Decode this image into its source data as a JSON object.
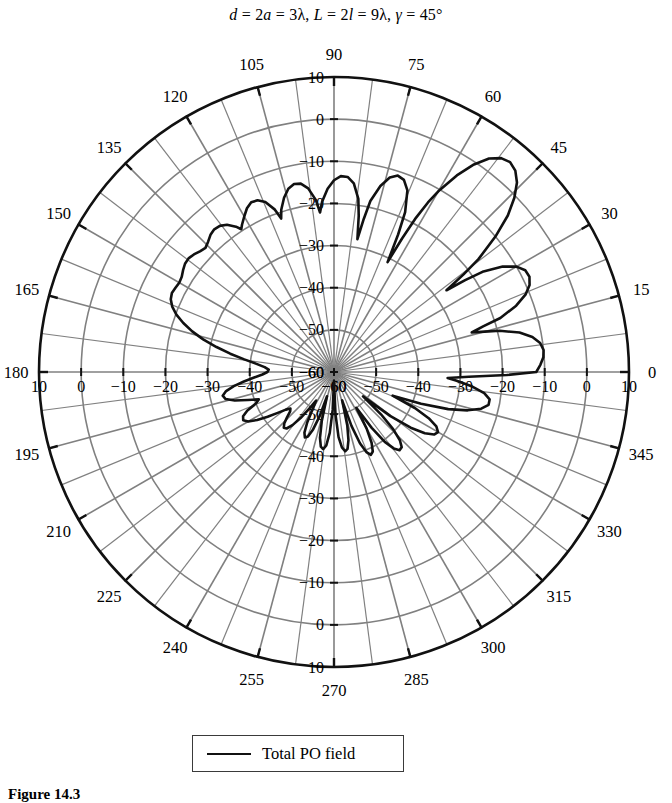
{
  "title": {
    "text": "d = 2a = 3λ, L = 2l = 9λ, γ = 45°",
    "parts": {
      "d": "d",
      "eq1": " = 2",
      "a": "a",
      "eq2": " = 3λ, ",
      "L": "L",
      "eq3": " = 2",
      "l": "l",
      "eq4": " = 9λ, ",
      "gamma": "γ",
      "eq5": " = 45°"
    }
  },
  "legend": {
    "entries": [
      {
        "label": "Total PO field",
        "color": "#111111",
        "style": "solid"
      }
    ]
  },
  "caption": {
    "text": "Figure 14.3"
  },
  "colors": {
    "curve": "#111111",
    "grid": "#808080",
    "outer_ring": "#111111",
    "text": "#000000",
    "background": "#ffffff"
  },
  "chart_data": {
    "type": "line",
    "plot_style": "polar",
    "title": "d = 2a = 3λ, L = 2l = 9λ, γ = 45°",
    "xlabel": "",
    "ylabel": "",
    "angle_unit": "degrees",
    "angle_direction": "counterclockwise",
    "angle_zero_at": "east",
    "angular_ticks": [
      0,
      15,
      30,
      45,
      60,
      75,
      90,
      105,
      120,
      135,
      150,
      165,
      180,
      195,
      210,
      225,
      240,
      255,
      270,
      285,
      300,
      315,
      330,
      345
    ],
    "angular_tick_labels": [
      "0",
      "15",
      "30",
      "45",
      "60",
      "75",
      "90",
      "105",
      "120",
      "135",
      "150",
      "165",
      "180",
      "195",
      "210",
      "225",
      "240",
      "255",
      "270",
      "285",
      "300",
      "315",
      "330",
      "345"
    ],
    "angular_minor_step": 7.5,
    "radial_ticks_db": [
      -60,
      -50,
      -40,
      -30,
      -20,
      -10,
      0,
      10
    ],
    "radial_tick_labels": [
      "−60",
      "−50",
      "−40",
      "−30",
      "−20",
      "−10",
      "0",
      "10"
    ],
    "rlim_db": [
      -60,
      10
    ],
    "radial_label_axes": [
      "90",
      "180",
      "0",
      "270"
    ],
    "grid": true,
    "legend_position": "below-plot",
    "series": [
      {
        "name": "Total PO field",
        "color": "#111111",
        "units": "dB",
        "description": "Physical-optics total far-field pattern of a reflector/horn; main beam near 45 deg reaching about +5 dB, broad smooth shoulder from 100-180 deg near -15 to -20 dB, dense narrow sidelobes through 250-350 deg.",
        "points_deg_db": [
          [
            0,
            -12.0
          ],
          [
            2,
            -11.0
          ],
          [
            4,
            -10.2
          ],
          [
            6,
            -10.0
          ],
          [
            8,
            -10.6
          ],
          [
            10,
            -12.2
          ],
          [
            12,
            -15.0
          ],
          [
            14,
            -19.5
          ],
          [
            15,
            -23.0
          ],
          [
            16,
            -26.0
          ],
          [
            17,
            -23.0
          ],
          [
            18,
            -18.5
          ],
          [
            20,
            -14.0
          ],
          [
            22,
            -11.0
          ],
          [
            24,
            -9.2
          ],
          [
            26,
            -8.4
          ],
          [
            28,
            -8.6
          ],
          [
            30,
            -10.0
          ],
          [
            32,
            -12.8
          ],
          [
            34,
            -17.5
          ],
          [
            35,
            -22.0
          ],
          [
            36,
            -27.0
          ],
          [
            37,
            -21.5
          ],
          [
            38,
            -16.5
          ],
          [
            40,
            -10.0
          ],
          [
            42,
            -4.5
          ],
          [
            44,
            -0.5
          ],
          [
            46,
            2.5
          ],
          [
            48,
            4.3
          ],
          [
            50,
            5.0
          ],
          [
            52,
            4.4
          ],
          [
            54,
            2.6
          ],
          [
            56,
            -0.6
          ],
          [
            58,
            -5.0
          ],
          [
            60,
            -10.5
          ],
          [
            61,
            -14.0
          ],
          [
            62,
            -18.5
          ],
          [
            63,
            -24.5
          ],
          [
            64,
            -31.0
          ],
          [
            65,
            -24.0
          ],
          [
            66,
            -18.5
          ],
          [
            68,
            -13.5
          ],
          [
            70,
            -11.5
          ],
          [
            72,
            -11.0
          ],
          [
            74,
            -12.0
          ],
          [
            76,
            -14.5
          ],
          [
            78,
            -18.5
          ],
          [
            79,
            -23.0
          ],
          [
            80,
            -28.0
          ],
          [
            81,
            -22.5
          ],
          [
            82,
            -18.5
          ],
          [
            84,
            -15.0
          ],
          [
            86,
            -13.6
          ],
          [
            88,
            -13.5
          ],
          [
            90,
            -14.5
          ],
          [
            92,
            -16.5
          ],
          [
            94,
            -19.5
          ],
          [
            95,
            -22.0
          ],
          [
            96,
            -19.0
          ],
          [
            98,
            -16.0
          ],
          [
            100,
            -14.6
          ],
          [
            102,
            -14.4
          ],
          [
            104,
            -15.2
          ],
          [
            106,
            -17.0
          ],
          [
            108,
            -19.5
          ],
          [
            109,
            -21.5
          ],
          [
            110,
            -19.0
          ],
          [
            112,
            -16.5
          ],
          [
            114,
            -15.4
          ],
          [
            116,
            -15.2
          ],
          [
            118,
            -16.0
          ],
          [
            120,
            -17.4
          ],
          [
            122,
            -18.8
          ],
          [
            123,
            -19.6
          ],
          [
            124,
            -18.4
          ],
          [
            126,
            -16.8
          ],
          [
            128,
            -16.0
          ],
          [
            130,
            -15.8
          ],
          [
            132,
            -16.2
          ],
          [
            134,
            -17.0
          ],
          [
            136,
            -17.6
          ],
          [
            138,
            -17.2
          ],
          [
            140,
            -16.6
          ],
          [
            142,
            -16.2
          ],
          [
            144,
            -16.3
          ],
          [
            146,
            -16.8
          ],
          [
            148,
            -17.4
          ],
          [
            150,
            -17.6
          ],
          [
            152,
            -17.4
          ],
          [
            154,
            -17.2
          ],
          [
            156,
            -17.6
          ],
          [
            158,
            -18.6
          ],
          [
            160,
            -20.2
          ],
          [
            162,
            -22.4
          ],
          [
            164,
            -25.0
          ],
          [
            166,
            -28.0
          ],
          [
            168,
            -31.5
          ],
          [
            170,
            -35.0
          ],
          [
            172,
            -38.5
          ],
          [
            174,
            -41.5
          ],
          [
            176,
            -43.5
          ],
          [
            178,
            -44.5
          ],
          [
            180,
            -44.2
          ],
          [
            182,
            -43.0
          ],
          [
            184,
            -41.0
          ],
          [
            186,
            -38.5
          ],
          [
            188,
            -36.0
          ],
          [
            190,
            -34.0
          ],
          [
            192,
            -33.0
          ],
          [
            194,
            -33.5
          ],
          [
            196,
            -35.5
          ],
          [
            198,
            -38.5
          ],
          [
            200,
            -41.0
          ],
          [
            202,
            -40.0
          ],
          [
            204,
            -37.5
          ],
          [
            206,
            -36.0
          ],
          [
            208,
            -35.6
          ],
          [
            210,
            -36.5
          ],
          [
            212,
            -38.5
          ],
          [
            214,
            -41.0
          ],
          [
            216,
            -43.5
          ],
          [
            218,
            -45.5
          ],
          [
            220,
            -46.5
          ],
          [
            222,
            -46.0
          ],
          [
            224,
            -44.5
          ],
          [
            226,
            -43.0
          ],
          [
            228,
            -42.2
          ],
          [
            230,
            -42.5
          ],
          [
            232,
            -44.0
          ],
          [
            234,
            -46.5
          ],
          [
            236,
            -49.5
          ],
          [
            238,
            -52.0
          ],
          [
            240,
            -50.0
          ],
          [
            242,
            -46.5
          ],
          [
            244,
            -44.0
          ],
          [
            246,
            -43.0
          ],
          [
            248,
            -43.5
          ],
          [
            250,
            -45.5
          ],
          [
            252,
            -49.0
          ],
          [
            254,
            -54.0
          ],
          [
            256,
            -48.0
          ],
          [
            258,
            -44.0
          ],
          [
            260,
            -42.0
          ],
          [
            262,
            -41.5
          ],
          [
            264,
            -42.5
          ],
          [
            266,
            -45.5
          ],
          [
            268,
            -51.0
          ],
          [
            270,
            -58.0
          ],
          [
            272,
            -50.0
          ],
          [
            274,
            -44.5
          ],
          [
            276,
            -42.0
          ],
          [
            278,
            -41.0
          ],
          [
            280,
            -41.5
          ],
          [
            282,
            -43.5
          ],
          [
            284,
            -47.0
          ],
          [
            286,
            -53.0
          ],
          [
            288,
            -46.5
          ],
          [
            290,
            -42.0
          ],
          [
            292,
            -39.5
          ],
          [
            294,
            -38.5
          ],
          [
            296,
            -39.0
          ],
          [
            298,
            -41.0
          ],
          [
            300,
            -44.5
          ],
          [
            302,
            -50.0
          ],
          [
            304,
            -44.0
          ],
          [
            306,
            -39.5
          ],
          [
            308,
            -37.0
          ],
          [
            310,
            -35.8
          ],
          [
            312,
            -36.0
          ],
          [
            314,
            -37.5
          ],
          [
            316,
            -40.5
          ],
          [
            318,
            -45.0
          ],
          [
            320,
            -51.0
          ],
          [
            322,
            -43.0
          ],
          [
            324,
            -37.5
          ],
          [
            326,
            -34.0
          ],
          [
            328,
            -32.0
          ],
          [
            330,
            -31.5
          ],
          [
            332,
            -32.5
          ],
          [
            334,
            -35.0
          ],
          [
            336,
            -39.0
          ],
          [
            338,
            -45.0
          ],
          [
            340,
            -38.0
          ],
          [
            342,
            -31.5
          ],
          [
            344,
            -27.0
          ],
          [
            346,
            -24.0
          ],
          [
            348,
            -22.5
          ],
          [
            350,
            -22.5
          ],
          [
            352,
            -24.0
          ],
          [
            354,
            -27.0
          ],
          [
            356,
            -31.0
          ],
          [
            357,
            -33.0
          ],
          [
            358,
            -28.0
          ],
          [
            359,
            -19.0
          ],
          [
            360,
            -12.0
          ]
        ]
      }
    ]
  }
}
